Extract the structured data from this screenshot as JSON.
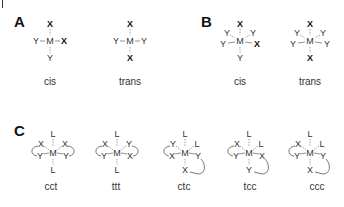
{
  "panels": {
    "A": {
      "label": "A",
      "structures": [
        {
          "caption": "cis",
          "center": "M",
          "top": "X",
          "left": "Y",
          "right": "X",
          "bottom": "Y"
        },
        {
          "caption": "trans",
          "center": "M",
          "top": "X",
          "left": "Y",
          "right": "Y",
          "bottom": "X"
        }
      ]
    },
    "B": {
      "label": "B",
      "structures": [
        {
          "caption": "cis",
          "center": "M",
          "top": "X",
          "upper_left": "Y",
          "upper_right": "Y",
          "left": "Y",
          "right": "X",
          "bottom": "Y"
        },
        {
          "caption": "trans",
          "center": "M",
          "top": "X",
          "upper_left": "Y",
          "upper_right": "Y",
          "left": "Y",
          "right": "Y",
          "bottom": "X"
        }
      ]
    },
    "C": {
      "label": "C",
      "structures": [
        {
          "caption": "cct",
          "center": "M",
          "top": "L",
          "upper_left": "X",
          "upper_right": "X",
          "left": "Y",
          "right": "Y",
          "bottom": "L"
        },
        {
          "caption": "ttt",
          "center": "M",
          "top": "L",
          "upper_left": "X",
          "upper_right": "Y",
          "left": "Y",
          "right": "X",
          "bottom": "L"
        },
        {
          "caption": "ctc",
          "center": "M",
          "top": "L",
          "upper_left": "Y",
          "upper_right": "L",
          "left": "X",
          "right": "Y",
          "bottom": "X"
        },
        {
          "caption": "tcc",
          "center": "M",
          "top": "L",
          "upper_left": "X",
          "upper_right": "L",
          "left": "Y",
          "right": "X",
          "bottom": "Y"
        },
        {
          "caption": "ccc",
          "center": "M",
          "top": "L",
          "upper_left": "X",
          "upper_right": "L",
          "left": "Y",
          "right": "Y",
          "bottom": "X"
        }
      ]
    }
  }
}
